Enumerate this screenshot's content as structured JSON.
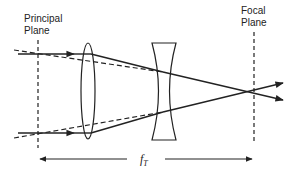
{
  "diagram": {
    "labels": {
      "principal_plane_line1": "Principal",
      "principal_plane_line2": "Plane",
      "focal_plane_line1": "Focal",
      "focal_plane_line2": "Plane",
      "focal_length": "f",
      "focal_length_subscript": "T"
    },
    "elements": [
      {
        "name": "principal-plane",
        "type": "dashed-vertical-line",
        "x": 38
      },
      {
        "name": "converging-lens",
        "type": "biconvex-lens",
        "x": 88
      },
      {
        "name": "diverging-lens",
        "type": "biconcave-lens",
        "x": 165
      },
      {
        "name": "focal-plane",
        "type": "dashed-vertical-line",
        "x": 254
      }
    ],
    "rays": [
      {
        "name": "upper-ray",
        "style": "solid",
        "with_arrow": true
      },
      {
        "name": "lower-ray",
        "style": "solid",
        "with_arrow": true
      },
      {
        "name": "upper-equivalent-ray",
        "style": "dashed"
      },
      {
        "name": "lower-equivalent-ray",
        "style": "dashed"
      }
    ],
    "colors": {
      "line": "#222222",
      "background": "#ffffff"
    }
  }
}
